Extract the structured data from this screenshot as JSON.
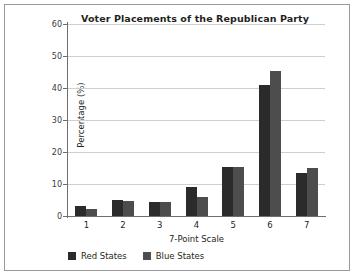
{
  "chart_data": {
    "type": "bar",
    "title": "Voter Placements of the Republican Party",
    "xlabel": "7-Point Scale",
    "ylabel": "Percentage (%)",
    "categories": [
      "1",
      "2",
      "3",
      "4",
      "5",
      "6",
      "7"
    ],
    "ylim": [
      0,
      60
    ],
    "yticks": [
      0,
      10,
      20,
      30,
      40,
      50,
      60
    ],
    "grid": true,
    "legend_position": "bottom-left",
    "series": [
      {
        "name": "Red States",
        "color": "#2b2b2b",
        "values": [
          3,
          5,
          4.5,
          9,
          15.3,
          41,
          13.4
        ]
      },
      {
        "name": "Blue States",
        "color": "#4d4d4d",
        "values": [
          2.2,
          4.7,
          4.3,
          6,
          15.3,
          45.3,
          15
        ]
      }
    ]
  },
  "frame": {
    "border_color": "#9a9a9a",
    "background": "#ffffff"
  }
}
